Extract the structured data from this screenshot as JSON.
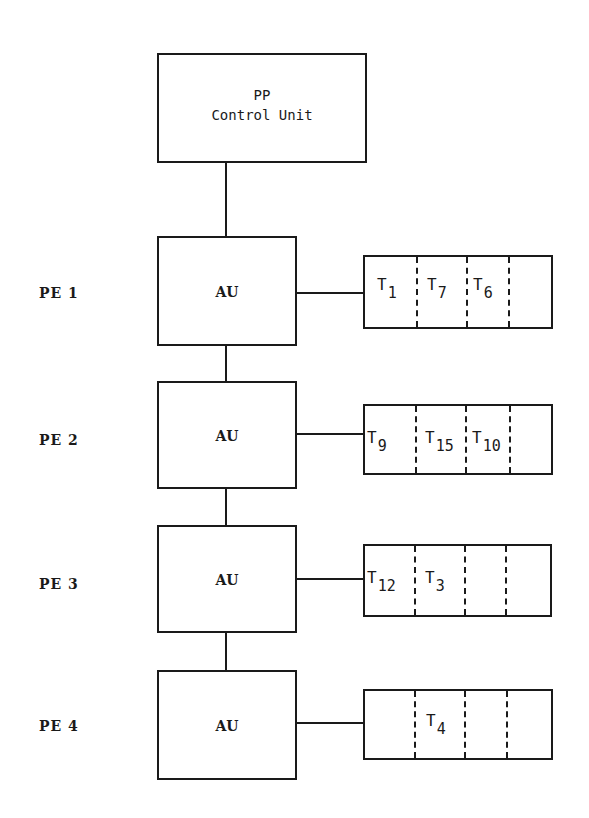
{
  "control_unit": {
    "line1": "PP",
    "line2": "Control Unit"
  },
  "processing_elements": [
    {
      "label": "PE 1",
      "unit": "AU",
      "queue": [
        {
          "t": "T",
          "n": "1"
        },
        {
          "t": "T",
          "n": "7"
        },
        {
          "t": "T",
          "n": "6"
        },
        {
          "t": "",
          "n": ""
        }
      ]
    },
    {
      "label": "PE 2",
      "unit": "AU",
      "queue": [
        {
          "t": "T",
          "n": "9"
        },
        {
          "t": "T",
          "n": "15"
        },
        {
          "t": "T",
          "n": "10"
        },
        {
          "t": "",
          "n": ""
        }
      ]
    },
    {
      "label": "PE 3",
      "unit": "AU",
      "queue": [
        {
          "t": "T",
          "n": "12"
        },
        {
          "t": "T",
          "n": "3"
        },
        {
          "t": "",
          "n": ""
        },
        {
          "t": "",
          "n": ""
        }
      ]
    },
    {
      "label": "PE 4",
      "unit": "AU",
      "queue": [
        {
          "t": "",
          "n": ""
        },
        {
          "t": "T",
          "n": "4"
        },
        {
          "t": "",
          "n": ""
        },
        {
          "t": "",
          "n": ""
        }
      ]
    }
  ],
  "colors": {
    "ink": "#1a1a1a",
    "background": "#ffffff"
  }
}
